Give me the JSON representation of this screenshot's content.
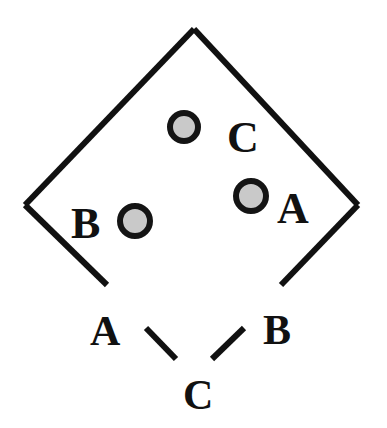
{
  "figure": {
    "background_color": "#ffffff",
    "stroke_color": "#111111",
    "circle_fill_color": "#c9c9c9",
    "circle_stroke_color": "#141414",
    "stroke_width_px": 6,
    "canvas": {
      "width": 387,
      "height": 428
    }
  },
  "shape": {
    "name": "diamond",
    "apex": {
      "x": 194,
      "y": 29
    },
    "left_vertex": {
      "x": 25,
      "y": 205
    },
    "right_vertex": {
      "x": 358,
      "y": 205
    },
    "lower_left_end": {
      "x": 107,
      "y": 285
    },
    "lower_right_end": {
      "x": 281,
      "y": 285
    }
  },
  "dashes": [
    {
      "name": "dash-left",
      "x1": 146,
      "y1": 328,
      "x2": 176,
      "y2": 359
    },
    {
      "name": "dash-right",
      "x1": 244,
      "y1": 328,
      "x2": 212,
      "y2": 359
    }
  ],
  "circles": [
    {
      "name": "circle-c",
      "label": "C",
      "cx": 184,
      "cy": 127,
      "r": 14,
      "ring_width": 6
    },
    {
      "name": "circle-a",
      "label": "A",
      "cx": 251,
      "cy": 196,
      "r": 15,
      "ring_width": 6
    },
    {
      "name": "circle-b",
      "label": "B",
      "cx": 135,
      "cy": 221,
      "r": 15,
      "ring_width": 6
    }
  ],
  "labels": {
    "inner": [
      {
        "name": "label-inner-c",
        "text": "C",
        "x": 227,
        "y": 152,
        "size": 44
      },
      {
        "name": "label-inner-a",
        "text": "A",
        "x": 277,
        "y": 223,
        "size": 44
      },
      {
        "name": "label-inner-b",
        "text": "B",
        "x": 71,
        "y": 238,
        "size": 44
      }
    ],
    "outer": [
      {
        "name": "label-outer-a",
        "text": "A",
        "x": 90,
        "y": 345,
        "size": 42
      },
      {
        "name": "label-outer-b",
        "text": "B",
        "x": 263,
        "y": 344,
        "size": 42
      },
      {
        "name": "label-outer-c",
        "text": "C",
        "x": 183,
        "y": 409,
        "size": 42
      }
    ]
  }
}
